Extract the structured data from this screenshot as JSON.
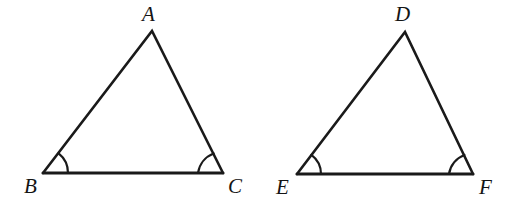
{
  "figure": {
    "background_color": "#ffffff",
    "stroke_color": "#1a1a1a",
    "label_color": "#141414",
    "width": 523,
    "height": 213
  },
  "triangles": [
    {
      "name": "triangle-abc",
      "vertices": [
        {
          "label": "A",
          "x": 152,
          "y": 31,
          "label_x": 142,
          "label_y": 4
        },
        {
          "label": "B",
          "x": 43,
          "y": 173,
          "label_x": 24,
          "label_y": 176
        },
        {
          "label": "C",
          "x": 223,
          "y": 173,
          "label_x": 228,
          "label_y": 176
        }
      ],
      "marked_angles": [
        "B",
        "C"
      ]
    },
    {
      "name": "triangle-def",
      "vertices": [
        {
          "label": "D",
          "x": 405,
          "y": 32,
          "label_x": 395,
          "label_y": 4
        },
        {
          "label": "E",
          "x": 297,
          "y": 174,
          "label_x": 276,
          "label_y": 177
        },
        {
          "label": "F",
          "x": 473,
          "y": 174,
          "label_x": 479,
          "label_y": 177
        }
      ],
      "marked_angles": [
        "E",
        "F"
      ]
    }
  ],
  "geometry_paths": {
    "abc_sides": "M 43 173 L 152 31 L 223 173",
    "abc_base": "M 43 173 L 223 173",
    "abc_arc_b": "M 68 173 A 25 25 0 0 0 58.6 153.4",
    "abc_arc_c": "M 198 173 A 25 25 0 0 1 213.6 153.5",
    "def_sides": "M 297 174 L 405 32 L 473 174",
    "def_base": "M 297 174 L 473 174",
    "def_arc_e": "M 321 174 A 24 24 0 0 0 311.4 154.9",
    "def_arc_f": "M 449 174 A 24 24 0 0 1 464.4 155.0"
  }
}
